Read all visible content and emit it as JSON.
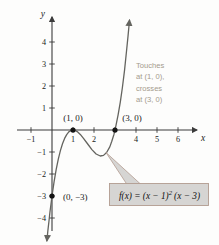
{
  "figure": {
    "x_axis_label": "x",
    "y_axis_label": "y",
    "annotation": {
      "lines": [
        "Touches",
        "at (1, 0),",
        "crosses",
        "at (3, 0)"
      ]
    },
    "formula": {
      "prefix": "f(x) = (x − 1)",
      "exponent": "2",
      "suffix": "(x − 3)"
    }
  },
  "chart_data": {
    "type": "line",
    "title": "",
    "function": "f(x) = (x − 1)² (x − 3)",
    "x_axis": {
      "label": "x",
      "range_shown": [
        -1.6,
        6.9
      ],
      "ticks": [
        -1,
        1,
        2,
        3,
        4,
        5,
        6
      ],
      "tick_labels": [
        "−1",
        "1",
        "2",
        "",
        "4",
        "5",
        "6"
      ]
    },
    "y_axis": {
      "label": "y",
      "range_shown": [
        -5.1,
        5.3
      ],
      "ticks": [
        4,
        3,
        2,
        1,
        -1,
        -2,
        -3,
        -4
      ],
      "tick_labels": [
        "4",
        "3",
        "2",
        "1",
        "−1",
        "−2",
        "−3",
        "−4"
      ]
    },
    "key_points": [
      {
        "x": 1,
        "y": 0,
        "label": "(1, 0)",
        "note": "touch point"
      },
      {
        "x": 3,
        "y": 0,
        "label": "(3, 0)",
        "note": "crossing point"
      },
      {
        "x": 0,
        "y": -3,
        "label": "(0, −3)",
        "note": "y-intercept"
      }
    ],
    "curve_samples": [
      [
        -0.245,
        -5.03
      ],
      [
        -0.2,
        -4.608
      ],
      [
        -0.15,
        -4.166
      ],
      [
        -0.1,
        -3.751
      ],
      [
        -0.05,
        -3.363
      ],
      [
        0,
        -3
      ],
      [
        0.1,
        -2.349
      ],
      [
        0.2,
        -1.792
      ],
      [
        0.3,
        -1.323
      ],
      [
        0.4,
        -0.936
      ],
      [
        0.5,
        -0.625
      ],
      [
        0.6,
        -0.384
      ],
      [
        0.7,
        -0.207
      ],
      [
        0.8,
        -0.088
      ],
      [
        0.9,
        -0.021
      ],
      [
        1,
        0
      ],
      [
        1.1,
        -0.019
      ],
      [
        1.2,
        -0.072
      ],
      [
        1.35,
        -0.202
      ],
      [
        1.5,
        -0.375
      ],
      [
        1.7,
        -0.637
      ],
      [
        1.9,
        -0.891
      ],
      [
        2.1,
        -1.089
      ],
      [
        2.3,
        -1.183
      ],
      [
        2.45,
        -1.156
      ],
      [
        2.6,
        -1.024
      ],
      [
        2.75,
        -0.766
      ],
      [
        2.85,
        -0.513
      ],
      [
        2.95,
        -0.19
      ],
      [
        3,
        0
      ],
      [
        3.05,
        0.21
      ],
      [
        3.15,
        0.693
      ],
      [
        3.25,
        1.266
      ],
      [
        3.35,
        1.933
      ],
      [
        3.45,
        2.701
      ],
      [
        3.55,
        3.576
      ],
      [
        3.62,
        4.256
      ],
      [
        3.69,
        4.993
      ]
    ],
    "colors": {
      "curve": "#64645f",
      "axis": "#3b3b3b",
      "text": "#1b1b1b",
      "annotation": "#a49b8c",
      "box_fill": "#d6d5d3",
      "box_border": "#b29c90"
    }
  }
}
